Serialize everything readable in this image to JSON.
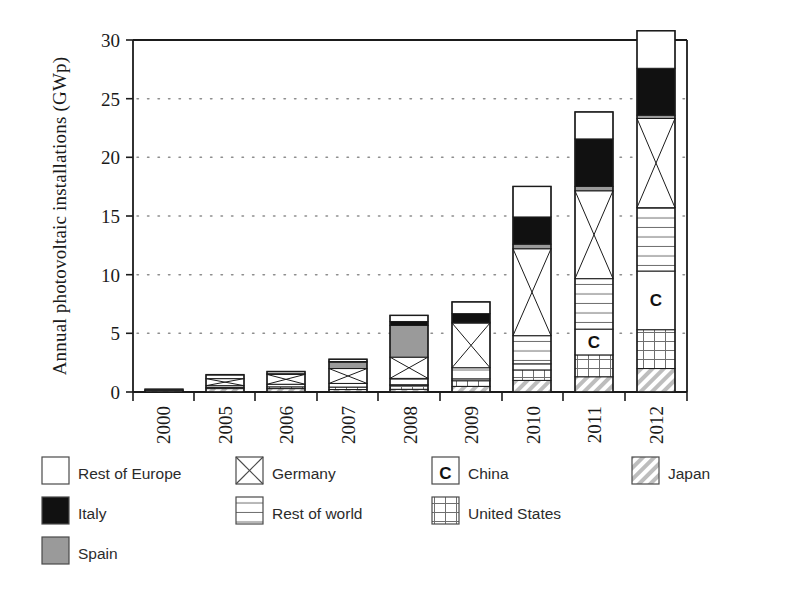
{
  "chart_data": {
    "type": "bar",
    "title": "",
    "subtitle": "",
    "xlabel": "",
    "ylabel": "Annual photovoltaic installations (GWp)",
    "categories": [
      "2000",
      "2005",
      "2006",
      "2007",
      "2008",
      "2009",
      "2010",
      "2011",
      "2012"
    ],
    "ylim": [
      0,
      30
    ],
    "yticks": [
      0,
      5,
      10,
      15,
      20,
      25,
      30
    ],
    "ytick_labels": [
      "0",
      "5",
      "10",
      "15",
      "20",
      "25",
      "30"
    ],
    "grid": "horizontal-dotted",
    "stacked": true,
    "stack_order_bottom_to_top": [
      "Japan",
      "United States",
      "China",
      "Rest of world",
      "Germany",
      "Spain",
      "Italy",
      "Rest of Europe"
    ],
    "legend_position": "below-plot",
    "series": [
      {
        "name": "Japan",
        "pattern": "diagonal-hatch",
        "color": "#d8d8d8",
        "values": [
          0.12,
          0.29,
          0.29,
          0.21,
          0.23,
          0.48,
          0.99,
          1.3,
          2.0
        ]
      },
      {
        "name": "United States",
        "pattern": "grid",
        "color": "#ffffff",
        "values": [
          0.02,
          0.1,
          0.15,
          0.21,
          0.34,
          0.48,
          0.89,
          1.86,
          3.31
        ]
      },
      {
        "name": "China",
        "pattern": "letter-c",
        "color": "#ffffff",
        "values": [
          0.0,
          0.01,
          0.01,
          0.02,
          0.05,
          0.16,
          0.52,
          2.2,
          5.0
        ]
      },
      {
        "name": "Rest of world",
        "pattern": "horizontal-lines",
        "color": "#ffffff",
        "values": [
          0.04,
          0.15,
          0.22,
          0.31,
          0.54,
          0.95,
          2.4,
          4.3,
          5.4
        ]
      },
      {
        "name": "Germany",
        "pattern": "cross-box",
        "color": "#ffffff",
        "values": [
          0.04,
          0.6,
          0.84,
          1.27,
          1.81,
          3.81,
          7.41,
          7.49,
          7.6
        ]
      },
      {
        "name": "Spain",
        "pattern": "solid-gray",
        "color": "#9a9a9a",
        "values": [
          0.0,
          0.02,
          0.06,
          0.55,
          2.7,
          0.07,
          0.39,
          0.37,
          0.28
        ]
      },
      {
        "name": "Italy",
        "pattern": "solid-black",
        "color": "#111111",
        "values": [
          0.0,
          0.01,
          0.01,
          0.05,
          0.34,
          0.73,
          2.32,
          4.05,
          4.0
        ]
      },
      {
        "name": "Rest of Europe",
        "pattern": "solid-white",
        "color": "#ffffff",
        "values": [
          0.03,
          0.3,
          0.17,
          0.18,
          0.52,
          1.0,
          2.6,
          2.3,
          3.2
        ]
      }
    ],
    "totals": [
      0.25,
      1.48,
      1.75,
      2.8,
      6.53,
      7.68,
      17.52,
      23.87,
      30.79
    ],
    "annotations": [
      {
        "text": "C",
        "bar": "2010",
        "meaning": "China segment marker"
      },
      {
        "text": "C",
        "bar": "2011",
        "meaning": "China segment marker"
      },
      {
        "text": "C",
        "bar": "2012",
        "meaning": "China segment marker"
      }
    ]
  },
  "legend": {
    "column1": [
      {
        "label": "Rest of Europe",
        "swatch": "solid-white"
      },
      {
        "label": "Italy",
        "swatch": "solid-black"
      },
      {
        "label": "Spain",
        "swatch": "solid-gray"
      }
    ],
    "column2": [
      {
        "label": "Germany",
        "swatch": "cross-box"
      },
      {
        "label": "Rest of world",
        "swatch": "horizontal-lines"
      }
    ],
    "column3": [
      {
        "label": "China",
        "swatch": "letter-c"
      },
      {
        "label": "United States",
        "swatch": "grid"
      }
    ],
    "column4": [
      {
        "label": "Japan",
        "swatch": "diagonal-hatch"
      }
    ]
  },
  "colors": {
    "axis": "#1b1b1b",
    "grid": "#9b9b9b",
    "italy": "#111111",
    "spain": "#9a9a9a",
    "background": "#ffffff"
  }
}
